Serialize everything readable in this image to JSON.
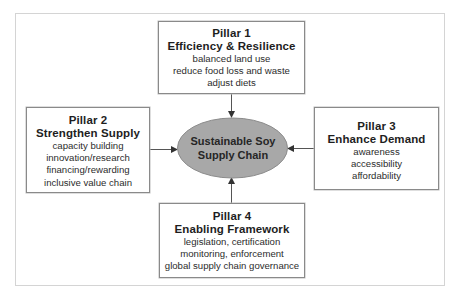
{
  "diagram": {
    "hub": {
      "label_lines": [
        "Sustainable Soy",
        "Supply Chain"
      ],
      "fill": "#a8a8a8",
      "stroke": "#8c8c8c"
    },
    "pillars": [
      {
        "id": "pillar1",
        "heading": "Pillar 1",
        "title": "Efficiency & Resilience",
        "items": [
          "balanced land use",
          "reduce food loss and waste",
          "adjust diets"
        ]
      },
      {
        "id": "pillar2",
        "heading": "Pillar 2",
        "title": "Strengthen Supply",
        "items": [
          "capacity building",
          "innovation/research",
          "financing/rewarding",
          "inclusive value chain"
        ]
      },
      {
        "id": "pillar3",
        "heading": "Pillar 3",
        "title": "Enhance Demand",
        "items": [
          "awareness",
          "accessibility",
          "affordability"
        ]
      },
      {
        "id": "pillar4",
        "heading": "Pillar 4",
        "title": "Enabling Framework",
        "items": [
          "legislation, certification",
          "monitoring, enforcement",
          "global supply chain governance"
        ]
      }
    ],
    "connections": [
      {
        "from": "pillar1",
        "to": "hub",
        "direction": "down"
      },
      {
        "from": "pillar2",
        "to": "hub",
        "direction": "right"
      },
      {
        "from": "pillar3",
        "to": "hub",
        "direction": "left"
      },
      {
        "from": "pillar4",
        "to": "hub",
        "direction": "up"
      }
    ],
    "colors": {
      "box_border": "#8a8a8a",
      "frame_border": "#d4d4d4",
      "arrow": "#333333",
      "text": "#222222"
    }
  }
}
